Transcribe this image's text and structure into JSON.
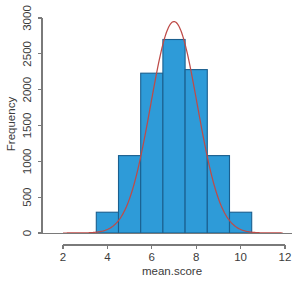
{
  "chart_data": {
    "type": "bar",
    "title": "",
    "subtitle": "",
    "xlabel": "mean.score",
    "ylabel": "Frequency",
    "xlim": [
      1.6,
      12.4
    ],
    "ylim": [
      0,
      3050
    ],
    "grid": false,
    "legend": "none",
    "xticks": [
      "2",
      "4",
      "6",
      "8",
      "10",
      "12"
    ],
    "xtick_values": [
      2,
      4,
      6,
      8,
      10,
      12
    ],
    "yticks": [
      "0",
      "500",
      "1000",
      "1500",
      "2000",
      "2500",
      "3000"
    ],
    "ytick_values": [
      0,
      500,
      1000,
      1500,
      2000,
      2500,
      3000
    ],
    "bin_width": 1,
    "bin_edges": [
      3.5,
      4.5,
      5.5,
      6.5,
      7.5,
      8.5,
      9.5,
      10.5
    ],
    "categories": [
      "3.5-4.5",
      "4.5-5.5",
      "5.5-6.5",
      "6.5-7.5",
      "7.5-8.5",
      "8.5-9.5",
      "9.5-10.5"
    ],
    "values": [
      290,
      1080,
      2230,
      2700,
      2280,
      1080,
      290
    ],
    "bar_fill_color": "#2E9BD8",
    "bar_border_color": "#1A5F8F",
    "overlay": {
      "name": "normal density curve",
      "type": "line",
      "color": "#BE4B48",
      "mean": 7.0,
      "sd": 1.05,
      "peak_value": 2950,
      "x_start": 2.0,
      "x_end": 11.9
    }
  },
  "axes": {
    "x_title": "mean.score",
    "y_title": "Frequency"
  }
}
